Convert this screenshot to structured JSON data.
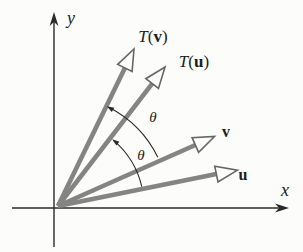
{
  "labels": {
    "y_axis": "y",
    "x_axis": "x",
    "Tv_T": "T",
    "Tv_open": "(",
    "Tv_arg": "v",
    "Tv_close": ")",
    "Tu_T": "T",
    "Tu_open": "(",
    "Tu_arg": "u",
    "Tu_close": ")",
    "v": "v",
    "u": "u",
    "theta_upper": "θ",
    "theta_lower": "θ"
  },
  "diagram": {
    "type": "vector-rotation-diagram",
    "vectors": [
      {
        "name": "u",
        "approx_angle_deg": 11
      },
      {
        "name": "v",
        "approx_angle_deg": 24
      },
      {
        "name": "T(u)",
        "approx_angle_deg": 52
      },
      {
        "name": "T(v)",
        "approx_angle_deg": 64
      }
    ],
    "angles": [
      {
        "label": "θ",
        "from": "u",
        "to": "T(u)"
      },
      {
        "label": "θ",
        "from": "v",
        "to": "T(v)"
      }
    ],
    "colors": {
      "vector_gray": "#848484",
      "arrowhead_outline": "#666666",
      "axis_black": "#2b2b2b",
      "background": "#fcfcfa"
    }
  }
}
